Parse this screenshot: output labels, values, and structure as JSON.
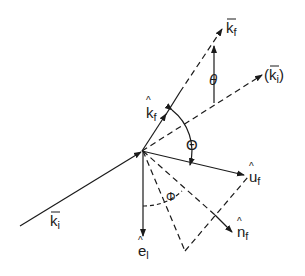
{
  "diagram": {
    "labels": {
      "k_f_vec": "k",
      "k_f_vec_sub": "f",
      "k_i_paren_open": "(",
      "k_i_paren": "k",
      "k_i_paren_sub": "i",
      "k_i_paren_close": ")",
      "k_f_hat": "k",
      "k_f_hat_sub": "f",
      "theta_small": "θ",
      "theta_big": "Θ",
      "phi": "Φ",
      "u_f": "u",
      "u_f_sub": "f",
      "n_f": "n",
      "n_f_sub": "f",
      "e_l": "e",
      "e_l_sub": "l",
      "k_i": "k",
      "k_i_sub": "i"
    },
    "colors": {
      "ink": "#1a1a1a",
      "background": "#ffffff"
    }
  }
}
